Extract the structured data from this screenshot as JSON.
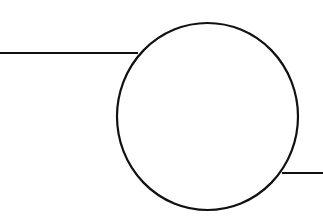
{
  "diagram": {
    "stroke_color": "#111111",
    "background": "#ffffff",
    "circle": {
      "cx": 207.5,
      "cy": 116.5,
      "rx": 90.5,
      "ry": 93.5,
      "stroke_width": 2.2
    },
    "line_left": {
      "x1": 0,
      "y1": 53,
      "x2": 138,
      "y2": 53
    },
    "line_right": {
      "x1": 282,
      "y1": 173,
      "x2": 323,
      "y2": 173
    }
  }
}
